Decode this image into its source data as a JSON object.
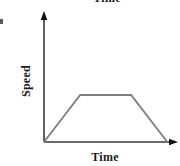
{
  "clipped": {
    "top_label": "Time"
  },
  "chart_data": {
    "type": "line",
    "title": "",
    "xlabel": "Time",
    "ylabel": "Speed",
    "x": [
      0,
      0.27,
      0.65,
      0.92
    ],
    "y": [
      0,
      1,
      1,
      0
    ],
    "xlim": [
      0,
      1
    ],
    "ylim": [
      0,
      2.7
    ],
    "grid": false,
    "tick_labels": "none",
    "legend": "none",
    "line_color": "#7d7d7d",
    "axis_color": "#3a3a3a",
    "arrow_color": "#111111"
  }
}
